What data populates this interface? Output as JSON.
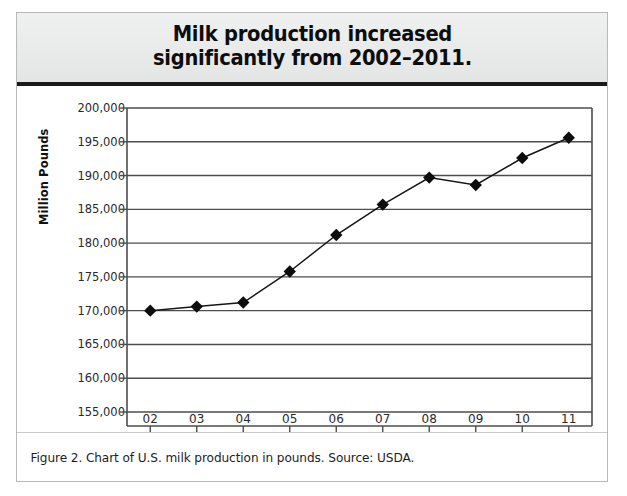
{
  "figure": {
    "title_line1": "Milk production increased",
    "title_line2": "significantly from 2002–2011.",
    "title_full": "Milk production increased\nsignificantly from 2002–2011.",
    "caption": "Figure 2. Chart of U.S. milk production in pounds. Source: USDA."
  },
  "colors": {
    "title_band_bg": "#e9ebeb",
    "title_rule": "#1b1b1b",
    "frame_border": "#b9b9b9",
    "gridline": "#4d4d4d",
    "axis": "#4d4d4d",
    "series_line": "#161616",
    "marker": "#0d0d0d",
    "text": "#1d1d1d"
  },
  "chart_data": {
    "type": "line",
    "title": "Milk production increased significantly from 2002–2011.",
    "subtitle": "",
    "xlabel": "",
    "ylabel": "Million Pounds",
    "categories": [
      "02",
      "03",
      "04",
      "05",
      "06",
      "07",
      "08",
      "09",
      "10",
      "11"
    ],
    "x_tick_labels": [
      "02",
      "03",
      "04",
      "05",
      "06",
      "07",
      "08",
      "09",
      "10",
      "11"
    ],
    "y_tick_labels": [
      "200,000",
      "195,000",
      "190,000",
      "185,000",
      "180,000",
      "175,000",
      "170,000",
      "165,000",
      "160,000",
      "155,000"
    ],
    "y_ticks": [
      200000,
      195000,
      190000,
      185000,
      180000,
      175000,
      170000,
      165000,
      160000,
      155000
    ],
    "ylim": [
      155000,
      200000
    ],
    "grid": true,
    "legend": "none",
    "series": [
      {
        "name": "U.S. milk production",
        "values": [
          170000,
          170600,
          171200,
          175800,
          181200,
          185700,
          189700,
          188600,
          192600,
          195600
        ]
      }
    ],
    "points": [
      {
        "x": "02",
        "y": 170000
      },
      {
        "x": "03",
        "y": 170600
      },
      {
        "x": "04",
        "y": 171200
      },
      {
        "x": "05",
        "y": 175800
      },
      {
        "x": "06",
        "y": 181200
      },
      {
        "x": "07",
        "y": 185700
      },
      {
        "x": "08",
        "y": 189700
      },
      {
        "x": "09",
        "y": 188600
      },
      {
        "x": "10",
        "y": 192600
      },
      {
        "x": "11",
        "y": 195600
      }
    ]
  }
}
